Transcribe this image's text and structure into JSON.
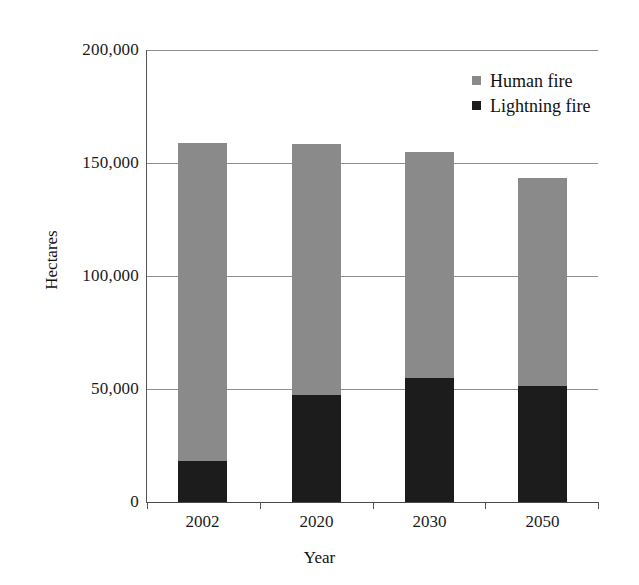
{
  "chart_data": {
    "type": "bar",
    "subtype": "stacked-column",
    "title": "",
    "xlabel": "Year",
    "ylabel": "Hectares",
    "categories": [
      "2002",
      "2020",
      "2030",
      "2050"
    ],
    "ylim": [
      0,
      200000
    ],
    "yticks": [
      0,
      50000,
      100000,
      150000,
      200000
    ],
    "ytick_labels": [
      "0",
      "50,000",
      "100,000",
      "150,000",
      "200,000"
    ],
    "grid": true,
    "legend_position": "top-right",
    "series": [
      {
        "name": "Human fire",
        "color": "#8a8a8a",
        "values": [
          141000,
          111000,
          100000,
          92000
        ]
      },
      {
        "name": "Lightning fire",
        "color": "#1c1c1c",
        "values": [
          18000,
          47500,
          55000,
          51500
        ]
      }
    ],
    "totals": [
      159000,
      158500,
      155000,
      143500
    ]
  },
  "axes": {
    "y_title": "Hectares",
    "x_title": "Year"
  },
  "legend": {
    "items": [
      {
        "label": "Human fire",
        "swatch_class": "human"
      },
      {
        "label": "Lightning fire",
        "swatch_class": "lightning"
      }
    ]
  }
}
